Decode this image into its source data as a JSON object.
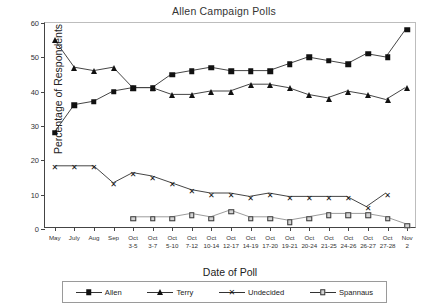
{
  "chart_data": {
    "type": "line",
    "title": "Allen Campaign Polls",
    "xlabel": "Date of Poll",
    "ylabel": "Percentage of Respondents",
    "ylim": [
      0,
      60
    ],
    "yticks": [
      0,
      10,
      20,
      30,
      40,
      50,
      60
    ],
    "grid": false,
    "legend_position": "bottom",
    "categories": [
      "May",
      "July",
      "Aug",
      "Sep",
      "Oct\n3-5",
      "Oct\n3-7",
      "Oct\n5-10",
      "Oct\n7-12",
      "Oct\n10-14",
      "Oct\n12-17",
      "Oct\n14-19",
      "Oct\n17-20",
      "Oct\n19-21",
      "Oct\n20-24",
      "Oct\n21-25",
      "Oct\n24-26",
      "Oct\n26-27",
      "Oct\n27-28",
      "Nov\n2"
    ],
    "series": [
      {
        "name": "Allen",
        "marker": "filled-square",
        "color": "#111111",
        "values": [
          28,
          36,
          37,
          40,
          41,
          41,
          45,
          46,
          47,
          46,
          46,
          46,
          48,
          50,
          49,
          48,
          51,
          50,
          58
        ]
      },
      {
        "name": "Terry",
        "marker": "filled-triangle",
        "color": "#111111",
        "values": [
          55,
          47,
          46,
          47,
          41,
          41,
          39,
          39,
          40,
          40,
          42,
          42,
          41,
          39,
          38,
          40,
          39,
          37.5,
          41
        ]
      },
      {
        "name": "Undecided",
        "marker": "x-cross",
        "color": "#111111",
        "values": [
          18,
          18,
          18,
          13,
          16,
          15,
          13,
          11,
          10,
          10,
          9,
          10,
          9,
          9,
          9,
          9,
          6,
          10,
          null
        ]
      },
      {
        "name": "Spannaus",
        "marker": "open-square",
        "color": "#d4d4d4",
        "values": [
          null,
          null,
          null,
          null,
          3,
          3,
          3,
          4,
          3,
          5,
          3,
          3,
          2,
          3,
          4,
          4,
          4,
          3,
          1
        ]
      }
    ]
  },
  "legend": {
    "items": [
      {
        "label": "Allen",
        "marker": "filled-square"
      },
      {
        "label": "Terry",
        "marker": "filled-triangle"
      },
      {
        "label": "Undecided",
        "marker": "x-cross"
      },
      {
        "label": "Spannaus",
        "marker": "open-square"
      }
    ]
  }
}
